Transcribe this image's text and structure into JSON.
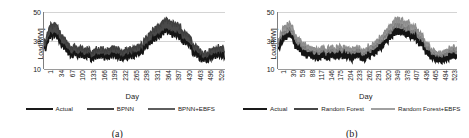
{
  "figure": {
    "panels": [
      {
        "id": "a",
        "caption": "(a)",
        "ylabel": "Load[MW]",
        "xlabel": "Day",
        "legend": [
          {
            "label": "Actual",
            "color": "#1a1a1a"
          },
          {
            "label": "BPNN",
            "color": "#3f3f3f"
          },
          {
            "label": "BPNN+EBFS",
            "color": "#5e5e5e"
          }
        ]
      },
      {
        "id": "b",
        "caption": "(b)",
        "ylabel": "Load[MW]",
        "xlabel": "Day",
        "legend": [
          {
            "label": "Actual",
            "color": "#1a1a1a"
          },
          {
            "label": "Random Forest",
            "color": "#464646"
          },
          {
            "label": "Random Forest+EBFS",
            "color": "#a0a0a0"
          }
        ]
      }
    ]
  },
  "chart_data": [
    {
      "type": "line",
      "title": "(a)",
      "xlabel": "Day",
      "ylabel": "Load[MW]",
      "ylim": [
        5,
        55
      ],
      "yticks": [
        10,
        30,
        50
      ],
      "xticks": [
        1,
        34,
        67,
        100,
        133,
        166,
        199,
        232,
        265,
        298,
        331,
        364,
        397,
        430,
        463,
        496,
        529
      ],
      "grid": true,
      "legend_position": "bottom",
      "series": [
        {
          "name": "Actual",
          "color": "#1a1a1a",
          "values": [
            14,
            15,
            13,
            16,
            14,
            13,
            15,
            14,
            16,
            15,
            14,
            16,
            18,
            17,
            19,
            18,
            20,
            19,
            21,
            22,
            24,
            23,
            25,
            24,
            26,
            25,
            27,
            26,
            28,
            27,
            29,
            28,
            30,
            29,
            28,
            27,
            26,
            24,
            22,
            20,
            18,
            16,
            14,
            13,
            14,
            13,
            12,
            13,
            14,
            13,
            14,
            15,
            16,
            18,
            20,
            22,
            24,
            23,
            25,
            24,
            23,
            22,
            21,
            20,
            19,
            18,
            17,
            16,
            15,
            14,
            15,
            14,
            13,
            14,
            13,
            14,
            13,
            12,
            13,
            12,
            13,
            12,
            13,
            14,
            13,
            12,
            13,
            12,
            13,
            12,
            13,
            12,
            13,
            12,
            13,
            12,
            13,
            14,
            13,
            12,
            13,
            12,
            13,
            12,
            13,
            14,
            13,
            12,
            13,
            12,
            13,
            14,
            13,
            12,
            13,
            12,
            13,
            12,
            13,
            14,
            15,
            14,
            13,
            12,
            13,
            14,
            13,
            12,
            13,
            12,
            13,
            14,
            13,
            12,
            13,
            12,
            13,
            14,
            15,
            14,
            13,
            12,
            13,
            14,
            13,
            12,
            13,
            14,
            13,
            12,
            13,
            14,
            15,
            14,
            13,
            12,
            13,
            14,
            13,
            12,
            13,
            14,
            13,
            12,
            13,
            14,
            13,
            12,
            13,
            14,
            15,
            14,
            13,
            12,
            13,
            14,
            13,
            12,
            13,
            14,
            13,
            12,
            13,
            14,
            13,
            12,
            13,
            14,
            13,
            12,
            13,
            14,
            15,
            14,
            13,
            12,
            13,
            14,
            13,
            12,
            13,
            14,
            13,
            12,
            13,
            14,
            13,
            12,
            13,
            14,
            13,
            12,
            13,
            14,
            15,
            14,
            13,
            12,
            13,
            14,
            13,
            12,
            13,
            14,
            13,
            12,
            13,
            14,
            13,
            12,
            13,
            14,
            13,
            12,
            13,
            14,
            13,
            12,
            13,
            14,
            15,
            14,
            13,
            12,
            13,
            14,
            13,
            12,
            13,
            14,
            13,
            12,
            13,
            14,
            13,
            12,
            13,
            14,
            13,
            12,
            13,
            14,
            15,
            16,
            15,
            14,
            13,
            14,
            15,
            14,
            13,
            14,
            15,
            16,
            15,
            14,
            15,
            16,
            17,
            16,
            15,
            16,
            17,
            18,
            17,
            16,
            17,
            18,
            19,
            18,
            17,
            18,
            19,
            20,
            19,
            18,
            19,
            20,
            21,
            20,
            19,
            20,
            21,
            22,
            21,
            20,
            21,
            22,
            21,
            20,
            19,
            20,
            21,
            22,
            23,
            22,
            21,
            22,
            23,
            22,
            21,
            22,
            23,
            24,
            23,
            22,
            21,
            22,
            23,
            22,
            21,
            22,
            23,
            22,
            21,
            20,
            21,
            22,
            23,
            24,
            25,
            24,
            23,
            22,
            23,
            24,
            25,
            26,
            25,
            24,
            23,
            24,
            25,
            24,
            23,
            22,
            23,
            24,
            25,
            24,
            23,
            22,
            23,
            24,
            23,
            22,
            21,
            22,
            23,
            24,
            23,
            22,
            21,
            22,
            23,
            22,
            21,
            22,
            23,
            24,
            23,
            22,
            21,
            22,
            23,
            22,
            21,
            20,
            21,
            22,
            21,
            20,
            19,
            20,
            21,
            20,
            19,
            18,
            19,
            20,
            19,
            18,
            17,
            18,
            19,
            18,
            17,
            16,
            17,
            18,
            17,
            16,
            15,
            16,
            17,
            16,
            15,
            14,
            15,
            16,
            15,
            14,
            13,
            14,
            15,
            14,
            13,
            12,
            13,
            14,
            13,
            12,
            13,
            12,
            13,
            12,
            11,
            12,
            13,
            12,
            11,
            12,
            13,
            12,
            11,
            12,
            13,
            12,
            11,
            12,
            13,
            12,
            11,
            12,
            13,
            14,
            13,
            12,
            13,
            14,
            13,
            12,
            13,
            14,
            13,
            12,
            13,
            14,
            15,
            14,
            13,
            14,
            15,
            14,
            13,
            14,
            15,
            16,
            15,
            14,
            15,
            16,
            15,
            14,
            15,
            16,
            15,
            14,
            15,
            16,
            15,
            14,
            13,
            14,
            15,
            16,
            15,
            14,
            15,
            16,
            15,
            14,
            15,
            16,
            15,
            14,
            13,
            14,
            15,
            14,
            13,
            14,
            15,
            16,
            15,
            14,
            15,
            16,
            15,
            14,
            15,
            16,
            17,
            16,
            15,
            14,
            15,
            16,
            15,
            14,
            15,
            16,
            15,
            14,
            15,
            16,
            15,
            14,
            15,
            16,
            15,
            14,
            13,
            14,
            15,
            16,
            15,
            14,
            15,
            16
          ]
        },
        {
          "name": "BPNN",
          "color": "#3f3f3f",
          "note": "forecast band upper envelope, overlaps actual forming dense dark band"
        },
        {
          "name": "BPNN+EBFS",
          "color": "#5e5e5e",
          "note": "forecast band, closely tracks actual"
        }
      ]
    },
    {
      "type": "line",
      "title": "(b)",
      "xlabel": "Day",
      "ylabel": "Load[MW]",
      "ylim": [
        5,
        55
      ],
      "yticks": [
        10,
        30,
        50
      ],
      "xticks": [
        1,
        30,
        59,
        88,
        117,
        146,
        175,
        204,
        233,
        262,
        291,
        320,
        349,
        378,
        407,
        436,
        465,
        494,
        523
      ],
      "grid": true,
      "legend_position": "bottom",
      "series": [
        {
          "name": "Actual",
          "color": "#1a1a1a",
          "note": "lower dark envelope of band"
        },
        {
          "name": "Random Forest",
          "color": "#464646",
          "note": "mid band"
        },
        {
          "name": "Random Forest+EBFS",
          "color": "#a0a0a0",
          "note": "light gray upper band"
        }
      ]
    }
  ]
}
